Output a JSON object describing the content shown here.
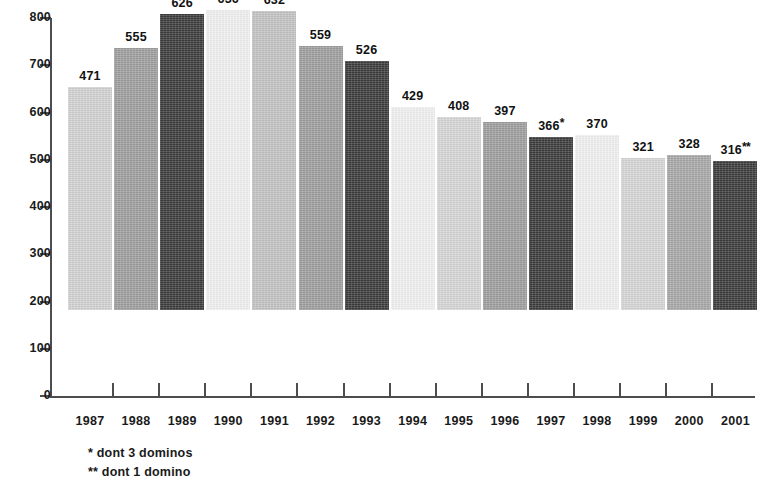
{
  "chart_data": {
    "type": "bar",
    "title": "",
    "subtitle": "",
    "xlabel": "",
    "ylabel": "",
    "ylim": [
      0,
      800
    ],
    "ytick_step": 100,
    "grid": false,
    "legend": "none",
    "yticks": [
      "800",
      "700",
      "600",
      "500",
      "400",
      "300",
      "200",
      "100",
      "0"
    ],
    "categories": [
      "1987",
      "1988",
      "1989",
      "1990",
      "1991",
      "1992",
      "1993",
      "1994",
      "1995",
      "1996",
      "1997",
      "1998",
      "1999",
      "2000",
      "2001"
    ],
    "values": [
      471,
      555,
      626,
      636,
      632,
      559,
      526,
      429,
      408,
      397,
      366,
      370,
      321,
      328,
      316
    ],
    "data_labels": [
      "471",
      "555",
      "626",
      "636",
      "632",
      "559",
      "526",
      "429",
      "408",
      "397",
      "366",
      "370",
      "321",
      "328",
      "316"
    ],
    "label_marks": [
      "",
      "",
      "",
      "",
      "",
      "",
      "",
      "",
      "",
      "",
      "*",
      "",
      "",
      "",
      "**"
    ],
    "bar_colors": [
      "#d2d2d2",
      "#9e9e9e",
      "#3b3b3b",
      "#f1f1f1",
      "#c3c3c3",
      "#9e9e9e",
      "#3b3b3b",
      "#f1f1f1",
      "#d6d6d6",
      "#9e9e9e",
      "#3b3b3b",
      "#f1f1f1",
      "#d6d6d6",
      "#a8a8a8",
      "#3b3b3b"
    ],
    "annotations": [
      "* dont 3 dominos",
      "** dont 1 domino"
    ],
    "axis_color": "#4d4d4d"
  },
  "footnotes": {
    "note_1": "* dont 3 dominos",
    "note_2": "** dont 1 domino"
  }
}
